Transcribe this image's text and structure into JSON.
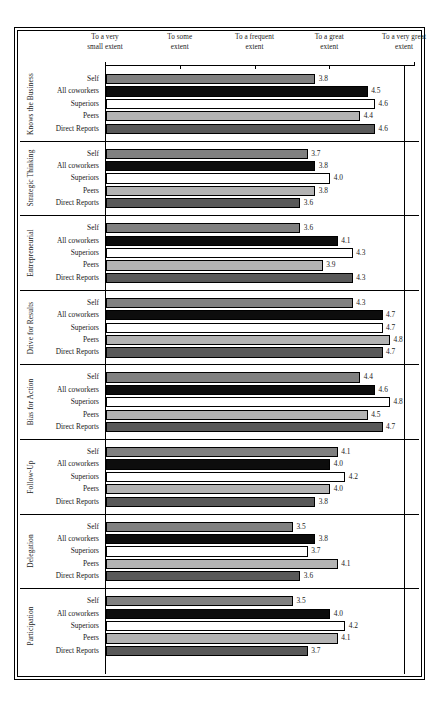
{
  "chart_data": {
    "type": "bar",
    "orientation": "horizontal",
    "title": "",
    "xlabel": "",
    "ylabel": "",
    "xlim": [
      1,
      5
    ],
    "grid": false,
    "legend": "none",
    "axis_tick_labels": [
      "To a very\nsmall extent",
      "To some\nextent",
      "To a frequent\nextent",
      "To a great\nextent",
      "To a very great\nextent"
    ],
    "axis_tick_values": [
      1,
      2,
      3,
      4,
      5
    ],
    "categories": [
      "Self",
      "All coworkers",
      "Superiors",
      "Peers",
      "Direct Reports"
    ],
    "series_colors": {
      "Self": "#808080",
      "All coworkers": "#0d0d0d",
      "Superiors": "#ffffff",
      "Peers": "#b3b3b3",
      "Direct Reports": "#595959"
    },
    "groups": [
      {
        "name": "Knows the Business",
        "values": [
          3.8,
          4.5,
          4.6,
          4.4,
          4.6
        ],
        "labels": [
          "3.8",
          "4.5",
          "4.6",
          "4.4",
          "4.6"
        ]
      },
      {
        "name": "Strategic Thinking",
        "values": [
          3.7,
          3.8,
          4.0,
          3.8,
          3.6
        ],
        "labels": [
          "3.7",
          "3.8",
          "4.0",
          "3.8",
          "3.6"
        ]
      },
      {
        "name": "Entrepreneurial",
        "values": [
          3.6,
          4.1,
          4.3,
          3.9,
          4.3
        ],
        "labels": [
          "3.6",
          "4.1",
          "4.3",
          "3.9",
          "4.3"
        ]
      },
      {
        "name": "Drive for Results",
        "values": [
          4.3,
          4.7,
          4.7,
          4.8,
          4.7
        ],
        "labels": [
          "4.3",
          "4.7",
          "4.7",
          "4.8",
          "4.7"
        ]
      },
      {
        "name": "Bias for Action",
        "values": [
          4.4,
          4.6,
          4.8,
          4.5,
          4.7
        ],
        "labels": [
          "4.4",
          "4.6",
          "4.8",
          "4.5",
          "4.7"
        ]
      },
      {
        "name": "Follow-Up",
        "values": [
          4.1,
          4.0,
          4.2,
          4.0,
          3.8
        ],
        "labels": [
          "4.1",
          "4.0",
          "4.2",
          "4.0",
          "3.8"
        ]
      },
      {
        "name": "Delegation",
        "values": [
          3.5,
          3.8,
          3.7,
          4.1,
          3.6
        ],
        "labels": [
          "3.5",
          "3.8",
          "3.7",
          "4.1",
          "3.6"
        ]
      },
      {
        "name": "Participation",
        "values": [
          3.5,
          4.0,
          4.2,
          4.1,
          3.7
        ],
        "labels": [
          "3.5",
          "4.0",
          "4.2",
          "4.1",
          "3.7"
        ]
      }
    ]
  }
}
